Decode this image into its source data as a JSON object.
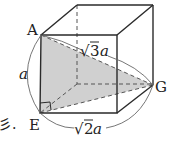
{
  "diagram": {
    "type": "cube-space-diagonal",
    "colors": {
      "edge": "#2a2a2a",
      "hidden_edge": "#555555",
      "shade": "#d0d0d0",
      "arc": "#666666",
      "text": "#222222"
    },
    "vertices": {
      "A": {
        "label": "A",
        "x": 41,
        "y": 35
      },
      "E": {
        "label": "E",
        "x": 40,
        "y": 113
      },
      "G": {
        "label": "G",
        "x": 153,
        "y": 85
      }
    },
    "labels": {
      "A": "A",
      "E": "E",
      "G": "G",
      "edge_AE": "a",
      "diag_EG_radical": "√",
      "diag_EG_num": "2",
      "diag_EG_var": "a",
      "diag_AG_radical": "√",
      "diag_AG_num": "3",
      "diag_AG_var": "a",
      "cropped_fragment": "彡."
    },
    "shaded_triangle": [
      "A",
      "E",
      "G"
    ],
    "right_angle_at": "E"
  }
}
